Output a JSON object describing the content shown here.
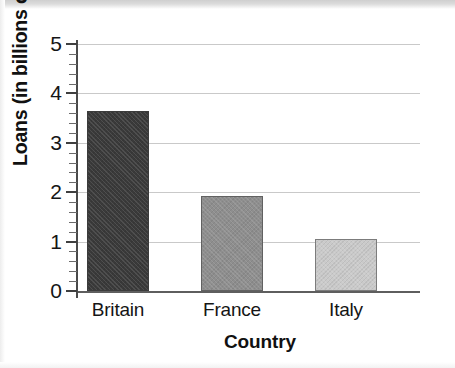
{
  "chart_data": {
    "type": "bar",
    "title": "",
    "subtitle": "",
    "xlabel": "Country",
    "ylabel": "Loans (in billions of dollars)",
    "categories": [
      "Britain",
      "France",
      "Italy"
    ],
    "values": [
      3.65,
      1.92,
      1.05
    ],
    "bar_colors": [
      "#3a3a3a",
      "#8e8e8e",
      "#cacaca"
    ],
    "ylim": [
      0,
      5
    ],
    "y_ticks": [
      0,
      1,
      2,
      3,
      4,
      5
    ],
    "y_tick_labels": [
      "0",
      "1",
      "2",
      "3",
      "4",
      "5"
    ],
    "y_minor_ticks_per_interval": 4,
    "grid": "horizontal",
    "legend": "none",
    "annotations": [],
    "units": "billions of dollars"
  },
  "style": {
    "gridline_color": "#c9c9c9",
    "axis_color": "#4a4a4a",
    "baseline_color": "#5e5e5e",
    "text_color": "#151515",
    "background": "#ffffff"
  }
}
